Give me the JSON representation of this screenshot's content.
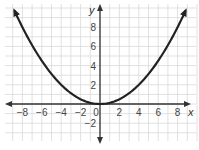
{
  "chart_data": {
    "type": "line",
    "title": "",
    "xlabel": "x",
    "ylabel": "y",
    "xlim": [
      -10,
      10
    ],
    "ylim": [
      -4,
      10
    ],
    "grid": true,
    "legend": "none",
    "x_ticks": [
      -8,
      -6,
      -4,
      -2,
      0,
      2,
      4,
      6,
      8
    ],
    "x_tick_labels": [
      "−8",
      "−6",
      "−4",
      "−2",
      "0",
      "2",
      "4",
      "6",
      "8"
    ],
    "y_ticks": [
      -2,
      2,
      4,
      6,
      8
    ],
    "y_tick_labels": [
      "−2",
      "2",
      "4",
      "6",
      "8"
    ],
    "series": [
      {
        "name": "y = x²/8",
        "equation": "y = x^2 / 8",
        "x": [
          -8.8,
          -8,
          -6,
          -4,
          -2,
          0,
          2,
          4,
          6,
          8,
          8.8
        ],
        "values": [
          9.68,
          8,
          4.5,
          2,
          0.5,
          0,
          0.5,
          2,
          4.5,
          8,
          9.68
        ],
        "arrows": "both ends",
        "color": "#222222"
      }
    ]
  },
  "colors": {
    "grid": "#d9d9d9",
    "axis": "#333333",
    "curve": "#222222",
    "text": "#444444"
  }
}
